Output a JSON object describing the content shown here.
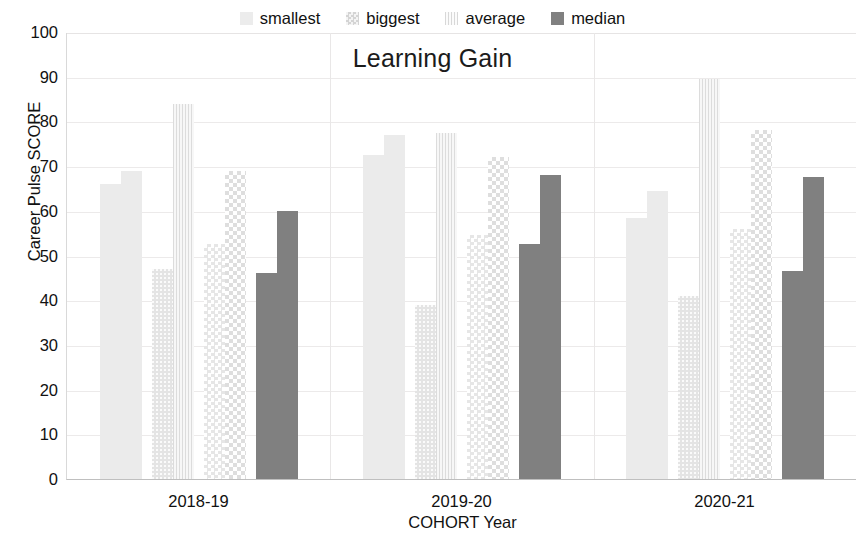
{
  "chart_data": {
    "type": "bar",
    "title": "Learning Gain",
    "xlabel": "COHORT Year",
    "ylabel": "Career Pulse SCORE",
    "categories": [
      "2018-19",
      "2019-20",
      "2020-21"
    ],
    "ylim": [
      0,
      100
    ],
    "yticks": [
      0,
      10,
      20,
      30,
      40,
      50,
      60,
      70,
      80,
      90,
      100
    ],
    "grid": true,
    "legend_position": "top-center",
    "legend": [
      "smallest",
      "biggest",
      "average",
      "median"
    ],
    "note": "Each legend series is drawn as a pre/post pair of bars within every cohort group.",
    "series": [
      {
        "name": "smallest",
        "color": "#ececec",
        "pattern": "fine-dots",
        "values_pre": [
          66,
          72.5,
          58.5
        ],
        "values_post": [
          69,
          77,
          64.5
        ]
      },
      {
        "name": "biggest",
        "color": "#e2e2e2",
        "pattern": "coarse-dots",
        "values_pre": [
          47,
          39,
          41
        ],
        "values_post": [
          84,
          77.5,
          89.5
        ]
      },
      {
        "name": "average",
        "color": "#f6f6f6",
        "pattern": "vertical-lines",
        "values_pre": [
          52.5,
          54.5,
          56
        ],
        "values_post": [
          69,
          72,
          78
        ]
      },
      {
        "name": "median",
        "color": "#808080",
        "pattern": "solid",
        "values_pre": [
          46,
          52.5,
          46.5
        ],
        "values_post": [
          60,
          68,
          67.5
        ]
      }
    ]
  },
  "legend": {
    "items": [
      {
        "label": "smallest",
        "swatch_class": "legend-smallest"
      },
      {
        "label": "biggest",
        "swatch_class": "legend-biggest"
      },
      {
        "label": "average",
        "swatch_class": "legend-average"
      },
      {
        "label": "median",
        "swatch_class": "legend-median"
      }
    ]
  }
}
